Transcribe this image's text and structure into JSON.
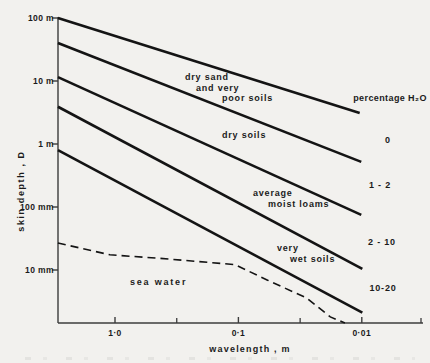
{
  "figure": {
    "background": "#f2f1ee",
    "line_color": "#141414",
    "axis_color": "#3c3c3c"
  },
  "chart_data": {
    "type": "line",
    "title": "",
    "x_axis": {
      "label": "wavelength , m",
      "scale": "log",
      "direction": "decreasing-right",
      "tick_labels": [
        "1·0",
        "0·1",
        "0·01"
      ],
      "tick_values": [
        1.0,
        0.1,
        0.01
      ],
      "minor_tick_values": [
        0.316,
        0.0316
      ],
      "end_tick": true,
      "range_m": [
        2.9,
        0.0032
      ]
    },
    "y_axis": {
      "label": "skin depth , D",
      "scale": "log",
      "tick_labels": [
        "100 m",
        "10 m",
        "1 m",
        "100 mm",
        "10 mm"
      ],
      "tick_values_m": [
        100,
        10,
        1,
        0.1,
        0.01
      ],
      "range_m": [
        100,
        0.0014
      ]
    },
    "boundary_lines": [
      {
        "name": "upper boundary - dry sand and very poor soils",
        "x_m": [
          2.9,
          0.0104
        ],
        "y_m": [
          100,
          3.1
        ]
      },
      {
        "name": "boundary dry sand / dry soils",
        "x_m": [
          2.9,
          0.0101
        ],
        "y_m": [
          40,
          0.52
        ]
      },
      {
        "name": "boundary dry soils / average moist loams",
        "x_m": [
          2.9,
          0.0101
        ],
        "y_m": [
          11.5,
          0.075
        ]
      },
      {
        "name": "boundary average moist loams / very wet soils",
        "x_m": [
          2.9,
          0.0099
        ],
        "y_m": [
          3.9,
          0.0104
        ]
      },
      {
        "name": "lower boundary - very wet soils",
        "x_m": [
          2.9,
          0.0099
        ],
        "y_m": [
          0.8,
          0.0021
        ]
      }
    ],
    "sea_water_curve": {
      "name": "sea water",
      "style": "dashed",
      "x_m": [
        2.9,
        1.1,
        0.47,
        0.107,
        0.058,
        0.028,
        0.018,
        0.0137
      ],
      "y_m": [
        0.0268,
        0.0174,
        0.0155,
        0.0122,
        0.0069,
        0.0036,
        0.0018,
        0.0014
      ]
    },
    "band_labels": [
      {
        "lines": [
          "dry sand",
          "and very",
          "poor soils"
        ],
        "percent_h2o": "0"
      },
      {
        "lines": [
          "dry soils"
        ],
        "percent_h2o": "1 - 2"
      },
      {
        "lines": [
          "average",
          "moist loams"
        ],
        "percent_h2o": "2 - 10"
      },
      {
        "lines": [
          "very",
          "wet soils"
        ],
        "percent_h2o": "10-20"
      },
      {
        "lines": [
          "sea water"
        ],
        "percent_h2o": ""
      }
    ],
    "percent_column": {
      "header": "percentage H₂O",
      "values": [
        "0",
        "1 - 2",
        "2 - 10",
        "10-20"
      ]
    }
  }
}
